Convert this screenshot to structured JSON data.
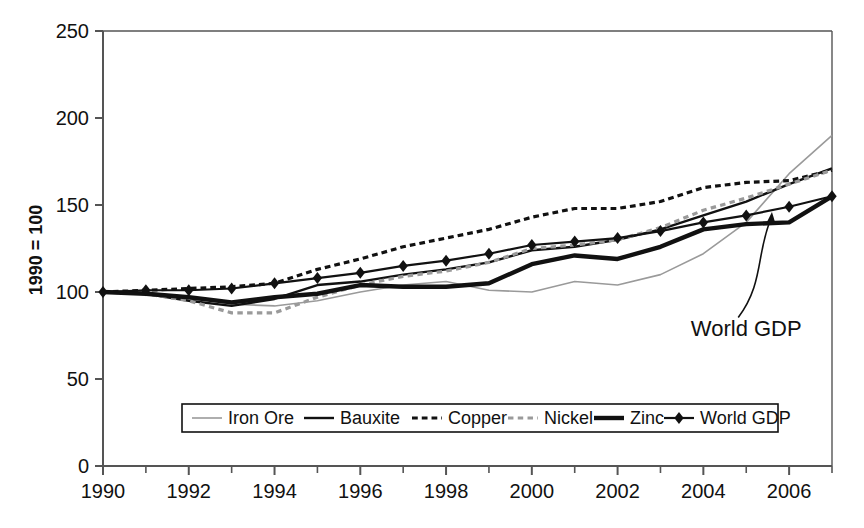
{
  "chart_data": {
    "type": "line",
    "title": "",
    "xlabel": "",
    "ylabel": "1990 = 100",
    "xlim": [
      1990,
      2007
    ],
    "ylim": [
      0,
      250
    ],
    "ytick_labels": [
      "0",
      "50",
      "100",
      "150",
      "200",
      "250"
    ],
    "yticks": [
      0,
      50,
      100,
      150,
      200,
      250
    ],
    "xtick_labels": [
      "1990",
      "1992",
      "1994",
      "1996",
      "1998",
      "2000",
      "2002",
      "2004",
      "2006"
    ],
    "xticks": [
      1990,
      1992,
      1994,
      1996,
      1998,
      2000,
      2002,
      2004,
      2006
    ],
    "minor_xticks": [
      1991,
      1993,
      1995,
      1997,
      1999,
      2001,
      2003,
      2005,
      2007
    ],
    "grid": false,
    "legend_position": "bottom-inside",
    "x": [
      1990,
      1991,
      1992,
      1993,
      1994,
      1995,
      1996,
      1997,
      1998,
      1999,
      2000,
      2001,
      2002,
      2003,
      2004,
      2005,
      2006,
      2007
    ],
    "series": [
      {
        "name": "Iron Ore",
        "style": "thin-gray-solid",
        "color": "#9a9a9a",
        "width": 1.6,
        "values": [
          100,
          100,
          97,
          93,
          92,
          95,
          100,
          104,
          106,
          101,
          100,
          106,
          104,
          110,
          122,
          140,
          168,
          190
        ]
      },
      {
        "name": "Bauxite",
        "style": "medium-black-solid",
        "color": "#111111",
        "width": 2.4,
        "values": [
          100,
          99,
          95,
          92,
          96,
          104,
          106,
          110,
          113,
          117,
          124,
          126,
          130,
          136,
          144,
          152,
          162,
          171
        ]
      },
      {
        "name": "Copper",
        "style": "black-dashed",
        "color": "#111111",
        "width": 3.2,
        "values": [
          100,
          101,
          102,
          103,
          105,
          113,
          119,
          126,
          131,
          136,
          143,
          148,
          148,
          152,
          160,
          163,
          164,
          170
        ]
      },
      {
        "name": "Nickel",
        "style": "gray-dashed",
        "color": "#9a9a9a",
        "width": 3.2,
        "values": [
          100,
          99,
          95,
          88,
          88,
          97,
          104,
          109,
          112,
          117,
          125,
          127,
          130,
          137,
          147,
          154,
          162,
          170
        ]
      },
      {
        "name": "Zinc",
        "style": "thick-black-solid",
        "color": "#111111",
        "width": 4.4,
        "values": [
          100,
          99,
          97,
          94,
          97,
          99,
          104,
          103,
          103,
          105,
          116,
          121,
          119,
          126,
          136,
          139,
          140,
          155
        ]
      },
      {
        "name": "World GDP",
        "style": "black-solid-diamond",
        "color": "#111111",
        "width": 2.2,
        "marker": "diamond",
        "values": [
          100,
          101,
          101,
          102,
          105,
          108,
          111,
          115,
          118,
          122,
          127,
          129,
          131,
          135,
          140,
          144,
          149,
          155
        ]
      }
    ],
    "annotations": [
      {
        "text": "World GDP",
        "x": 2005.0,
        "y": 75,
        "points_to_x": 2005.6,
        "points_to_y": 146
      }
    ]
  },
  "legend": {
    "items": [
      {
        "label": "Iron Ore",
        "swatch": "thin-gray-solid"
      },
      {
        "label": "Bauxite",
        "swatch": "medium-black-solid"
      },
      {
        "label": "Copper",
        "swatch": "black-dashed"
      },
      {
        "label": "Nickel",
        "swatch": "gray-dashed"
      },
      {
        "label": "Zinc",
        "swatch": "thick-black-solid"
      },
      {
        "label": "World GDP",
        "swatch": "black-solid-diamond"
      }
    ]
  },
  "colors": {
    "axis": "#555555",
    "dark_line": "#111111",
    "gray_line": "#9a9a9a",
    "background": "#ffffff"
  }
}
